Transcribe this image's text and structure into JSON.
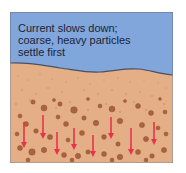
{
  "diagram": {
    "caption_lines": [
      "Current slows down;",
      "coarse, heavy particles",
      "settle first"
    ],
    "colors": {
      "water": "#80a6dc",
      "sediment": "#e4ae86",
      "boundary_line": "#4a5160",
      "particle": "#a8643c",
      "arrow": "#e8344a",
      "frame": "#6b6f7a"
    },
    "arrows": [
      {
        "x": 24,
        "y1": 122,
        "y2": 148
      },
      {
        "x": 43,
        "y1": 115,
        "y2": 139
      },
      {
        "x": 57,
        "y1": 132,
        "y2": 155
      },
      {
        "x": 74,
        "y1": 128,
        "y2": 150
      },
      {
        "x": 93,
        "y1": 135,
        "y2": 157
      },
      {
        "x": 111,
        "y1": 117,
        "y2": 139
      },
      {
        "x": 131,
        "y1": 128,
        "y2": 155
      },
      {
        "x": 154,
        "y1": 122,
        "y2": 145
      }
    ]
  }
}
